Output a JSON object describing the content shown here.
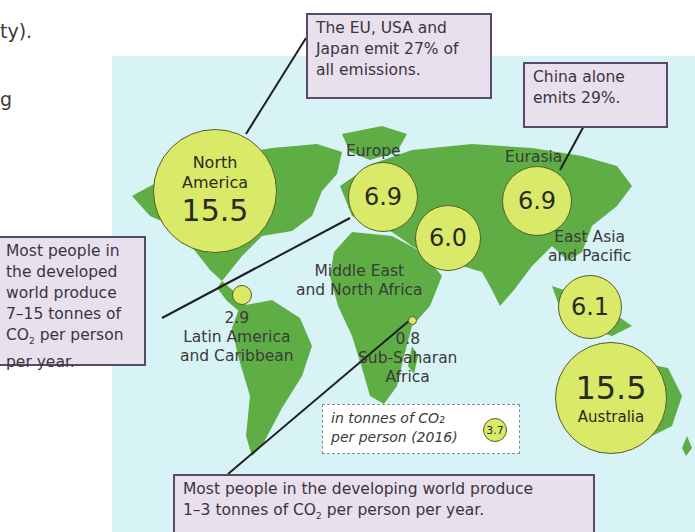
{
  "page_fragments": {
    "line1": "ty).",
    "line2": "g"
  },
  "map": {
    "units_legend": {
      "line1": "in tonnes of CO₂",
      "line2": "per person (2016)",
      "sample_value": "3.7"
    },
    "regions": [
      {
        "name": "North America",
        "line1": "North",
        "line2": "America",
        "value": "15.5"
      },
      {
        "name": "Europe",
        "label": "Europe",
        "value": "6.9"
      },
      {
        "name": "Eurasia",
        "label": "Eurasia",
        "value": "6.9"
      },
      {
        "name": "Middle East and North Africa",
        "line1": "Middle East",
        "line2": "and North Africa",
        "value": "6.0"
      },
      {
        "name": "East Asia and Pacific",
        "line1": "East Asia",
        "line2": "and Pacific",
        "value": "6.1"
      },
      {
        "name": "Latin America and Caribbean",
        "line1": "Latin America",
        "line2": "and Caribbean",
        "value": "2.9"
      },
      {
        "name": "Sub-Saharan Africa",
        "line1": "Sub-Saharan",
        "line2": "Africa",
        "value": "0.8"
      },
      {
        "name": "Australia",
        "label": "Australia",
        "value": "15.5"
      }
    ]
  },
  "callouts": {
    "eu_usa_japan": {
      "line1": "The EU, USA and",
      "line2": "Japan emit 27% of",
      "line3": "all emissions."
    },
    "china": {
      "line1": "China alone",
      "line2": "emits 29%."
    },
    "developed": {
      "line1": "Most people in",
      "line2": "the developed",
      "line3": "world produce",
      "line4": "7–15 tonnes of",
      "line5a": "CO",
      "line5sub": "2",
      "line5b": " per person",
      "line6": "per year."
    },
    "developing": {
      "line1": "Most people in the developing world produce",
      "line2a": "1–3 tonnes of CO",
      "line2sub": "2",
      "line2b": " per person per year."
    }
  },
  "colors": {
    "ocean": "#d8f3f6",
    "land": "#5fae45",
    "bubble": "#d9ea68",
    "callout_bg": "#e9e0ee",
    "callout_border": "#5a4a6a"
  }
}
